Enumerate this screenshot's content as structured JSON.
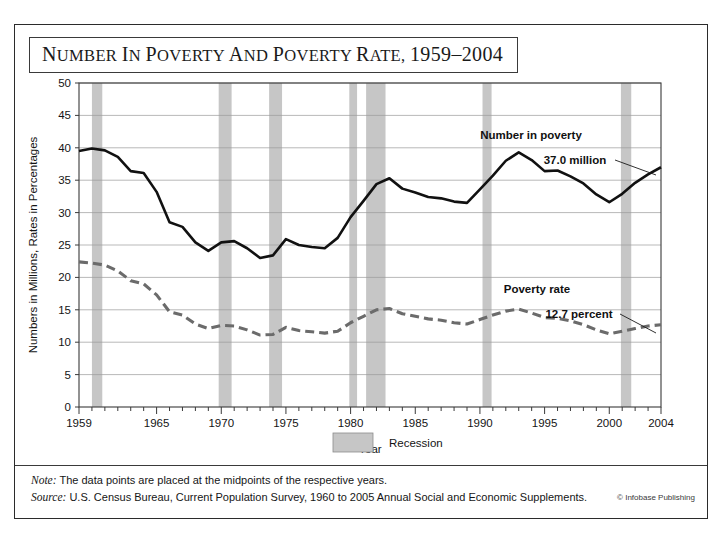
{
  "figure": {
    "title": "Number in Poverty and Poverty Rate, 1959–2004",
    "note": "The data points are placed at the midpoints of the respective years.",
    "note_label": "Note:",
    "source_label": "Source:",
    "source": "U.S. Census Bureau, Current Population Survey, 1960 to 2005 Annual Social and Economic Supplements.",
    "credit": "© Infobase Publishing"
  },
  "legend": {
    "recession_label": "Recession",
    "recession_color": "#c6c6c6"
  },
  "annotations": {
    "number_series_label": "Number in poverty",
    "number_value_label": "37.0 million",
    "rate_series_label": "Poverty rate",
    "rate_value_label": "12.7 percent"
  },
  "chart_data": {
    "type": "line",
    "title": "Number in Poverty and Poverty Rate, 1959–2004",
    "xlabel": "Year",
    "ylabel": "Numbers in Millions, Rates in Percentages",
    "xlim": [
      1959,
      2004
    ],
    "ylim": [
      0,
      50
    ],
    "ytick_step": 5,
    "yticks": [
      0,
      5,
      10,
      15,
      20,
      25,
      30,
      35,
      40,
      45,
      50
    ],
    "xticks_labeled": [
      1959,
      1965,
      1970,
      1975,
      1980,
      1985,
      1990,
      1995,
      2000,
      2004
    ],
    "xtick_every": 1,
    "grid": "horizontal",
    "legend_position": "below-axes-center",
    "x": [
      1959,
      1960,
      1961,
      1962,
      1963,
      1964,
      1965,
      1966,
      1967,
      1968,
      1969,
      1970,
      1971,
      1972,
      1973,
      1974,
      1975,
      1976,
      1977,
      1978,
      1979,
      1980,
      1981,
      1982,
      1983,
      1984,
      1985,
      1986,
      1987,
      1988,
      1989,
      1990,
      1991,
      1992,
      1993,
      1994,
      1995,
      1996,
      1997,
      1998,
      1999,
      2000,
      2001,
      2002,
      2003,
      2004
    ],
    "series": [
      {
        "name": "Number in poverty",
        "units": "millions",
        "style": "solid",
        "color": "#111111",
        "values": [
          39.5,
          39.9,
          39.6,
          38.6,
          36.4,
          36.1,
          33.2,
          28.5,
          27.8,
          25.4,
          24.1,
          25.4,
          25.6,
          24.5,
          23.0,
          23.4,
          25.9,
          25.0,
          24.7,
          24.5,
          26.1,
          29.3,
          31.8,
          34.4,
          35.3,
          33.7,
          33.1,
          32.4,
          32.2,
          31.7,
          31.5,
          33.6,
          35.7,
          38.0,
          39.3,
          38.1,
          36.4,
          36.5,
          35.6,
          34.5,
          32.8,
          31.6,
          32.9,
          34.6,
          35.9,
          37.0
        ]
      },
      {
        "name": "Poverty rate",
        "units": "percent",
        "style": "dashed",
        "color": "#6b6b6b",
        "values": [
          22.4,
          22.2,
          21.9,
          21.0,
          19.5,
          19.0,
          17.3,
          14.7,
          14.2,
          12.8,
          12.1,
          12.6,
          12.5,
          11.9,
          11.1,
          11.2,
          12.3,
          11.8,
          11.6,
          11.4,
          11.7,
          13.0,
          14.0,
          15.0,
          15.2,
          14.4,
          14.0,
          13.6,
          13.4,
          13.0,
          12.8,
          13.5,
          14.2,
          14.8,
          15.1,
          14.5,
          13.8,
          13.7,
          13.3,
          12.7,
          11.9,
          11.3,
          11.7,
          12.1,
          12.5,
          12.7
        ]
      }
    ],
    "recession_bands": [
      {
        "start": 1960.0,
        "end": 1960.8
      },
      {
        "start": 1969.8,
        "end": 1970.8
      },
      {
        "start": 1973.7,
        "end": 1974.7
      },
      {
        "start": 1979.9,
        "end": 1980.5
      },
      {
        "start": 1981.2,
        "end": 1982.7
      },
      {
        "start": 1990.2,
        "end": 1990.9
      },
      {
        "start": 2000.9,
        "end": 2001.7
      }
    ]
  }
}
